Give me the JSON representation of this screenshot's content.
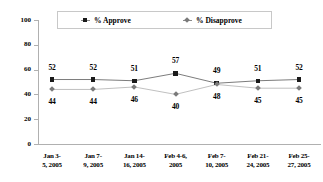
{
  "chart_data": {
    "type": "line",
    "title": "",
    "xlabel": "",
    "ylabel": "",
    "ylim": [
      0,
      100
    ],
    "yticks": [
      "0",
      "20",
      "40",
      "60",
      "80",
      "100"
    ],
    "grid": false,
    "legend_position": "top-center",
    "categories": [
      "Jan 3-5, 2005",
      "Jan 7-9, 2005",
      "Jan 14-16, 2005",
      "Feb 4-6, 2005",
      "Feb 7-10, 2005",
      "Feb 21-24, 2005",
      "Feb 25-27, 2005"
    ],
    "category_lines": [
      [
        "Jan  3-",
        "5, 2005"
      ],
      [
        "Jan  7-",
        "9, 2005"
      ],
      [
        "Jan  14-",
        "16, 2005"
      ],
      [
        "Feb  4-6,",
        "2005"
      ],
      [
        "Feb  7-",
        "10, 2005"
      ],
      [
        "Feb  21-",
        "24, 2005"
      ],
      [
        "Feb  25-",
        "27, 2005"
      ]
    ],
    "series": [
      {
        "name": "% Approve",
        "marker": "square",
        "color": "#1a1a1a",
        "line_color": "#5a5a5a",
        "values": [
          52,
          52,
          51,
          57,
          49,
          51,
          52
        ],
        "label_position": "above"
      },
      {
        "name": "% Disapprove",
        "marker": "diamond",
        "color": "#7a7a7a",
        "line_color": "#b0b0b0",
        "values": [
          44,
          44,
          46,
          40,
          48,
          45,
          45
        ],
        "label_position": "below"
      }
    ]
  },
  "legend": {
    "approve_label": "% Approve",
    "disapprove_label": "% Disapprove"
  },
  "colors": {
    "approve": "#1a1a1a",
    "disapprove": "#7a7a7a",
    "axis": "#b0b0b0",
    "background": "#ffffff"
  }
}
